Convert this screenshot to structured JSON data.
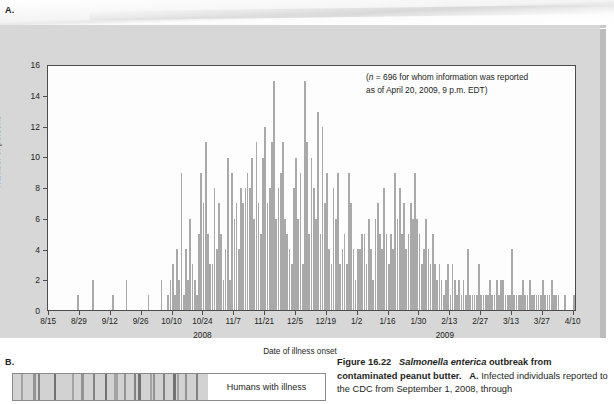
{
  "panels": {
    "a_letter": "A.",
    "b_letter": "B."
  },
  "ghost_text": {
    "line1": "Lesson on Putt",
    "line2": "anus Carrier?"
  },
  "chart_data": {
    "type": "bar",
    "title": "",
    "subtitle": "",
    "annotation_line1": "(n = 696 for whom information was reported",
    "annotation_line2": "as of April 20, 2009, 9 p.m. EDT)",
    "annotation_italic_var": "n",
    "xlabel": "Date of illness onset",
    "ylabel": "Number of persons",
    "ylim": [
      0,
      16
    ],
    "ytick_values": [
      0,
      2,
      4,
      6,
      8,
      10,
      12,
      14,
      16
    ],
    "ytick_labels": [
      "0",
      "2",
      "4",
      "6",
      "8",
      "10",
      "12",
      "14",
      "16"
    ],
    "grid": false,
    "legend": "none",
    "bar_color": "#a9a9a9",
    "x_start_date": "8/15",
    "x_end_date": "4/10",
    "xtick_labels": [
      "8/15",
      "8/29",
      "9/12",
      "9/26",
      "10/10",
      "10/24",
      "11/7",
      "11/21",
      "12/5",
      "12/19",
      "1/2",
      "1/16",
      "1/30",
      "2/13",
      "2/27",
      "3/13",
      "3/27",
      "4/10"
    ],
    "xtick_interval_days": 14,
    "year_group_labels": [
      {
        "label": "2008",
        "at_index": 70
      },
      {
        "label": "2009",
        "at_index": 180
      }
    ],
    "total_n": 696,
    "values": [
      0,
      0,
      0,
      0,
      0,
      0,
      0,
      0,
      0,
      0,
      0,
      0,
      0,
      1,
      0,
      0,
      0,
      0,
      0,
      0,
      2,
      0,
      0,
      0,
      0,
      0,
      0,
      0,
      0,
      1,
      0,
      0,
      0,
      0,
      0,
      2,
      0,
      0,
      0,
      0,
      0,
      0,
      0,
      0,
      0,
      1,
      0,
      0,
      0,
      0,
      0,
      2,
      0,
      0,
      1,
      2,
      3,
      1,
      4,
      2,
      9,
      1,
      4,
      2,
      6,
      3,
      2,
      1,
      5,
      9,
      7,
      11,
      5,
      3,
      3,
      8,
      4,
      7,
      5,
      2,
      4,
      10,
      2,
      9,
      6,
      7,
      4,
      8,
      7,
      8,
      9,
      8,
      10,
      6,
      11,
      7,
      5,
      10,
      12,
      7,
      8,
      11,
      15,
      6,
      8,
      9,
      11,
      6,
      5,
      4,
      3,
      8,
      10,
      6,
      9,
      3,
      15,
      11,
      5,
      10,
      8,
      6,
      13,
      5,
      12,
      7,
      9,
      4,
      3,
      8,
      6,
      9,
      3,
      4,
      5,
      3,
      9,
      7,
      4,
      2,
      4,
      4,
      5,
      5,
      3,
      6,
      4,
      2,
      6,
      7,
      5,
      4,
      8,
      5,
      3,
      5,
      4,
      9,
      6,
      8,
      5,
      7,
      4,
      5,
      7,
      6,
      9,
      6,
      5,
      3,
      4,
      6,
      4,
      3,
      5,
      3,
      2,
      3,
      2,
      1,
      2,
      3,
      1,
      3,
      2,
      1,
      2,
      1,
      2,
      1,
      4,
      1,
      1,
      1,
      1,
      3,
      1,
      1,
      1,
      1,
      2,
      1,
      1,
      2,
      1,
      2,
      2,
      1,
      1,
      1,
      4,
      1,
      1,
      1,
      1,
      2,
      1,
      1,
      2,
      1,
      1,
      1,
      1,
      1,
      2,
      1,
      1,
      1,
      2,
      1,
      1,
      1,
      0,
      0,
      1,
      0,
      0,
      0,
      1,
      0
    ]
  },
  "gel": {
    "label": "Humans with illness",
    "band_positions_pct": [
      4,
      10,
      13,
      21,
      30,
      35,
      41,
      47,
      52,
      57,
      62,
      64,
      70,
      72,
      77,
      82,
      84,
      88,
      94
    ],
    "band_widths_px": [
      2,
      3,
      2,
      2,
      2,
      3,
      2,
      2,
      4,
      2,
      2,
      3,
      2,
      2,
      2,
      3,
      2,
      2,
      2
    ]
  },
  "caption": {
    "figure_number": "Figure 16.22",
    "organism": "Salmonella enterica",
    "title_rest": "outbreak from contaminated peanut butter.",
    "part_label": "A.",
    "body": "Infected individuals reported to the CDC from September 1, 2008, through"
  }
}
